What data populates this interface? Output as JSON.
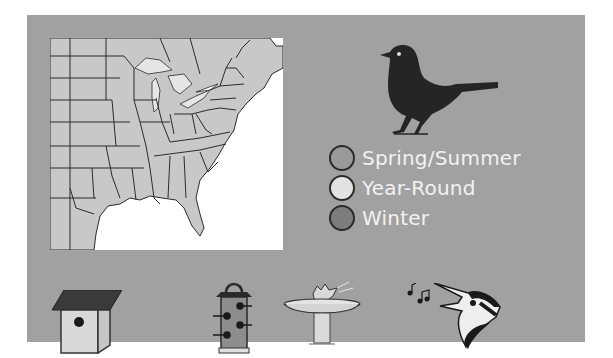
{
  "colors": {
    "panel_background": "#a1a1a1",
    "map_land": "#c8c8c8",
    "map_water": "#ffffff",
    "border_lines": "#2b2b2b",
    "label_text": "#f2f2f2"
  },
  "map": {
    "region": "Eastern United States",
    "description": "Range map of eastern US states with Great Lakes and Gulf coast"
  },
  "bird_silhouette": {
    "icon": "songbird-silhouette-icon"
  },
  "legend": {
    "items": [
      {
        "label": "Spring/Summer",
        "color": "#9a9a9a"
      },
      {
        "label": "Year-Round",
        "color": "#e2e2e2"
      },
      {
        "label": "Winter",
        "color": "#7d7d7d"
      }
    ]
  },
  "bottom_icons": [
    {
      "name": "birdhouse-icon",
      "meaning": "Nest box"
    },
    {
      "name": "tube-feeder-icon",
      "meaning": "Feeder"
    },
    {
      "name": "birdbath-icon",
      "meaning": "Bird bath"
    },
    {
      "name": "singing-bird-icon",
      "meaning": "Song"
    }
  ]
}
